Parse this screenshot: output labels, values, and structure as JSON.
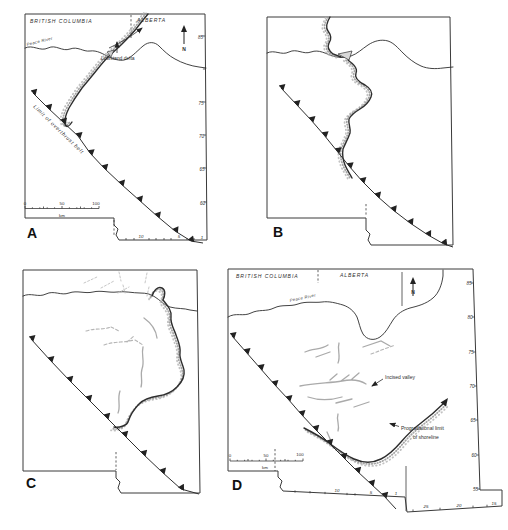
{
  "figure": {
    "colors": {
      "ink": "#2e2e2e",
      "stipple": "#9a9a9a",
      "channel": "#aaaaaa",
      "background": "#ffffff"
    },
    "panel_a": {
      "label": "A",
      "region_left": "BRITISH COLUMBIA",
      "region_right": "ALBERTA",
      "river_label": "Peace River",
      "north_label": "N",
      "delta_label": "Lowstand delta",
      "thrust_label": "Limit of overthrust belt",
      "ticks_right": [
        "85",
        "75",
        "70",
        "65",
        "60"
      ],
      "ticks_bottom": [
        "10",
        "5",
        "1"
      ],
      "scale": {
        "zero": "0",
        "fifty": "50",
        "hundred": "100",
        "unit": "km"
      }
    },
    "panel_b": {
      "label": "B"
    },
    "panel_c": {
      "label": "C"
    },
    "panel_d": {
      "label": "D",
      "region_left": "BRITISH COLUMBIA",
      "region_right": "ALBERTA",
      "river_label": "Peace River",
      "north_label": "N",
      "incised_label": "Incised valley",
      "prograd_label_line1": "Progradational limit",
      "prograd_label_line2": "of shoreline",
      "ticks_right": [
        "85",
        "80",
        "75",
        "70",
        "65",
        "60",
        "55"
      ],
      "ticks_bottom": [
        "10",
        "5",
        "1"
      ],
      "ticks_bottom_right": [
        "25",
        "20",
        "15"
      ],
      "scale": {
        "zero": "0",
        "fifty": "50",
        "hundred": "100",
        "unit": "km"
      }
    }
  }
}
